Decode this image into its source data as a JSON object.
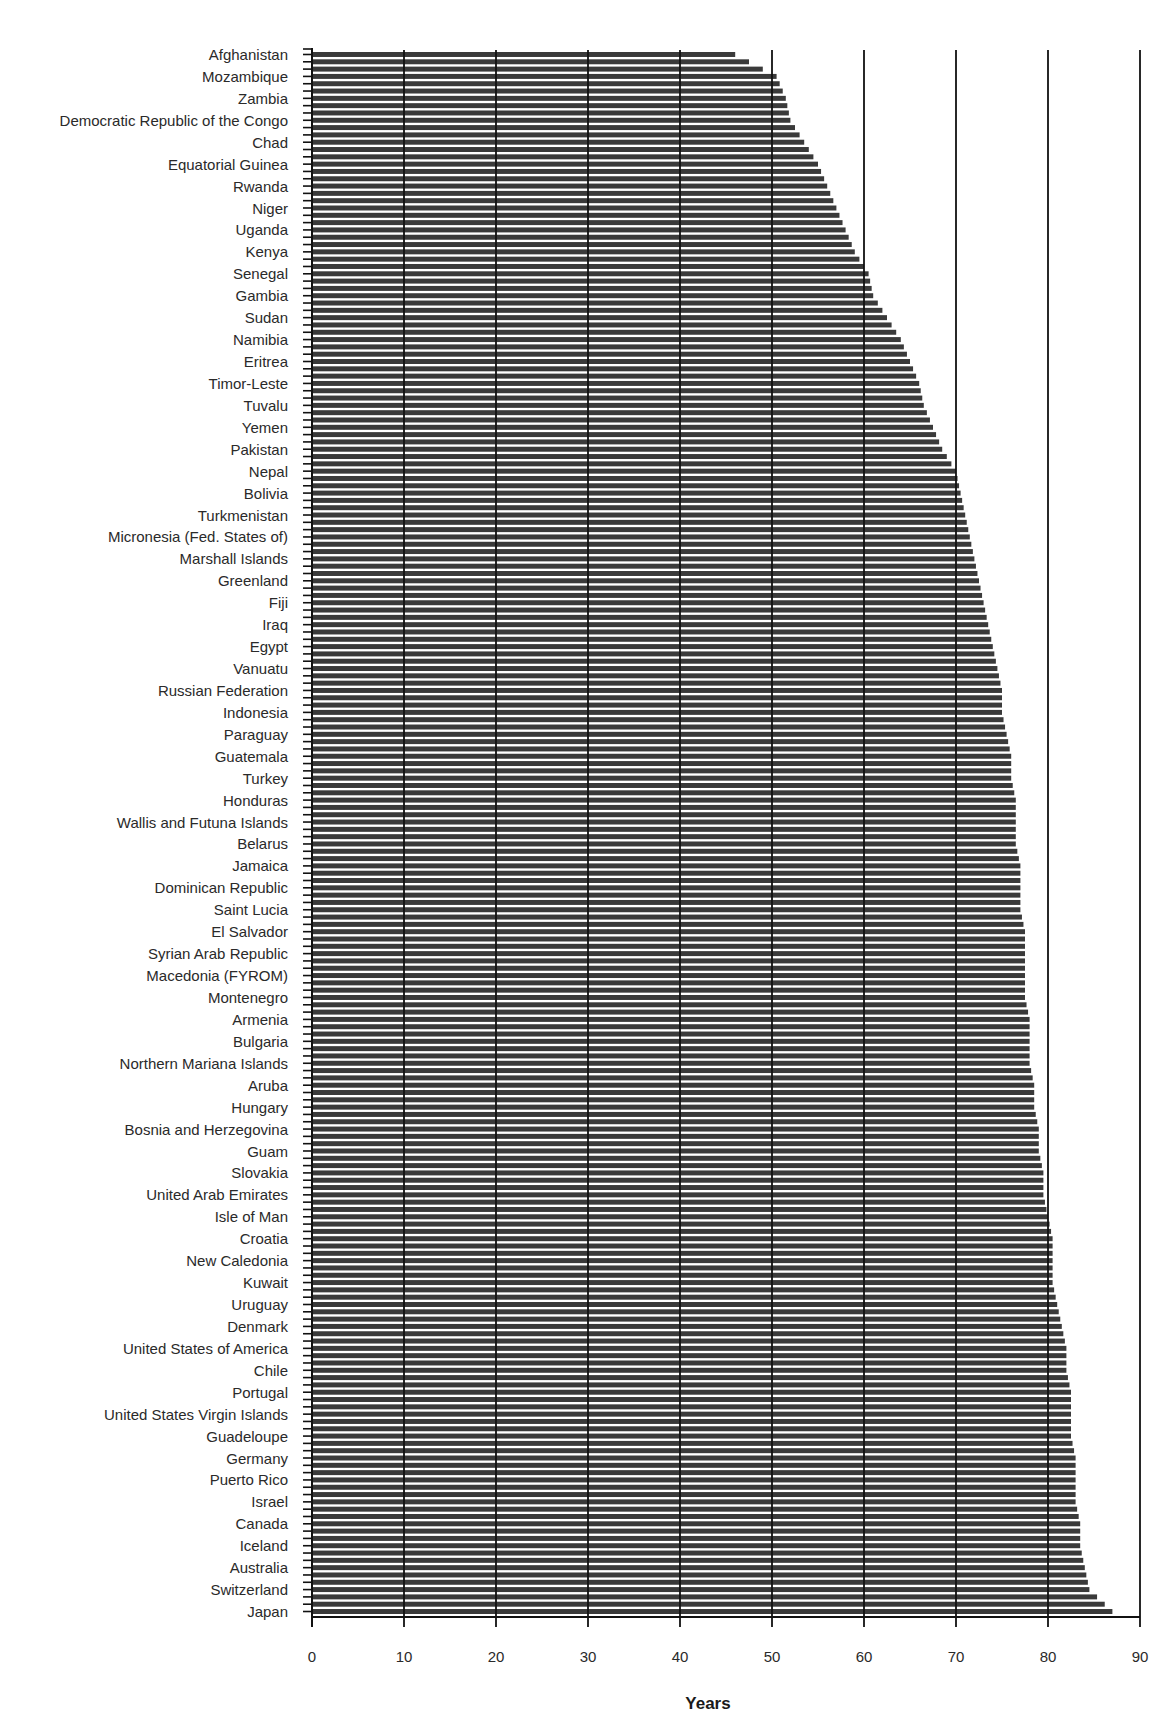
{
  "chart_data": {
    "type": "bar",
    "orientation": "horizontal",
    "title": "",
    "xlabel": "Years",
    "ylabel": "",
    "xlim": [
      0,
      90
    ],
    "x_ticks": [
      0,
      10,
      20,
      30,
      40,
      50,
      60,
      70,
      80,
      90
    ],
    "grid": {
      "vertical": true,
      "horizontal": false
    },
    "legend": null,
    "bar_color": "#3a3a3a",
    "bars_per_label": 3,
    "labeled_categories": [
      "Afghanistan",
      "Mozambique",
      "Zambia",
      "Democratic Republic of the Congo",
      "Chad",
      "Equatorial Guinea",
      "Rwanda",
      "Niger",
      "Uganda",
      "Kenya",
      "Senegal",
      "Gambia",
      "Sudan",
      "Namibia",
      "Eritrea",
      "Timor-Leste",
      "Tuvalu",
      "Yemen",
      "Pakistan",
      "Nepal",
      "Bolivia",
      "Turkmenistan",
      "Micronesia (Fed. States of)",
      "Marshall Islands",
      "Greenland",
      "Fiji",
      "Iraq",
      "Egypt",
      "Vanuatu",
      "Russian Federation",
      "Indonesia",
      "Paraguay",
      "Guatemala",
      "Turkey",
      "Honduras",
      "Wallis and Futuna Islands",
      "Belarus",
      "Jamaica",
      "Dominican Republic",
      "Saint Lucia",
      "El Salvador",
      "Syrian Arab Republic",
      "Macedonia (FYROM)",
      "Montenegro",
      "Armenia",
      "Bulgaria",
      "Northern Mariana Islands",
      "Aruba",
      "Hungary",
      "Bosnia and Herzegovina",
      "Guam",
      "Slovakia",
      "United Arab Emirates",
      "Isle of Man",
      "Croatia",
      "New Caledonia",
      "Kuwait",
      "Uruguay",
      "Denmark",
      "United States of America",
      "Chile",
      "Portugal",
      "United States Virgin Islands",
      "Guadeloupe",
      "Germany",
      "Puerto Rico",
      "Israel",
      "Canada",
      "Iceland",
      "Australia",
      "Switzerland",
      "Japan"
    ],
    "labeled_values": [
      46,
      50.5,
      51.5,
      52,
      53.5,
      55,
      56,
      57,
      58,
      59,
      60.5,
      61,
      62.5,
      64,
      65,
      66,
      66.5,
      67.5,
      68.5,
      70,
      70.5,
      71,
      71.5,
      72,
      72.5,
      73,
      73.5,
      74,
      74.5,
      75,
      75,
      75.5,
      76,
      76,
      76.5,
      76.5,
      76.5,
      77,
      77,
      77,
      77.5,
      77.5,
      77.5,
      77.5,
      78,
      78,
      78,
      78.5,
      78.5,
      79,
      79,
      79.5,
      79.5,
      80,
      80.5,
      80.5,
      80.5,
      81,
      81.5,
      82,
      82,
      82.5,
      82.5,
      82.5,
      83,
      83,
      83,
      83.5,
      83.5,
      84,
      84.5,
      87
    ]
  }
}
